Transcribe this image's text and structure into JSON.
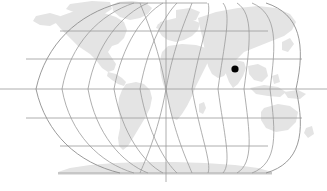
{
  "figure": {
    "type": "world-map",
    "projection": "robinson",
    "title": "",
    "background_color": "#ffffff",
    "width": 327,
    "height": 191
  },
  "map": {
    "land_color": "#e4e4e4",
    "graticule_color": "#9a9a9a",
    "outline_color": "#8f8f8f",
    "graticule": {
      "meridian_interval_degrees": 30,
      "parallel_interval_degrees": 30,
      "meridians": [
        -180,
        -150,
        -120,
        -90,
        -60,
        -30,
        0,
        30,
        60,
        90,
        120,
        150,
        180
      ],
      "parallels": [
        -90,
        -60,
        -30,
        0,
        30,
        60,
        90
      ],
      "equator_visible": true,
      "central_meridian_visible": true
    },
    "continents": [
      "North America",
      "South America",
      "Europe",
      "Africa",
      "Asia",
      "Australia",
      "Antarctica",
      "Greenland"
    ]
  },
  "markers": [
    {
      "label": "",
      "color": "#000000",
      "radius_px": 3.6,
      "x_px": 235,
      "y_px": 69,
      "region": "South Asia"
    }
  ],
  "chart_data": {
    "type": "scatter",
    "title": "",
    "xlabel": "",
    "ylabel": "",
    "projection": "robinson",
    "xlim": [
      -180,
      180
    ],
    "ylim": [
      -90,
      90
    ],
    "grid": true,
    "legend": "none",
    "series": [
      {
        "name": "location-marker",
        "color": "#000000",
        "marker": "circle",
        "values": [
          {
            "x_px": 235,
            "y_px": 69
          }
        ]
      }
    ]
  }
}
